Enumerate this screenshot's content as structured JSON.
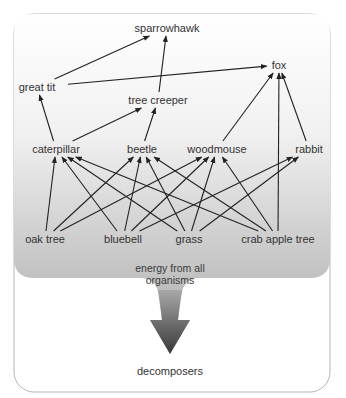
{
  "diagram": {
    "nodes": {
      "sparrowhawk": {
        "label": "sparrowhawk",
        "x": 167,
        "y": 28
      },
      "fox": {
        "label": "fox",
        "x": 279,
        "y": 65
      },
      "great_tit": {
        "label": "great tit",
        "x": 37,
        "y": 87
      },
      "tree_creeper": {
        "label": "tree creeper",
        "x": 158,
        "y": 100
      },
      "caterpillar": {
        "label": "caterpillar",
        "x": 56,
        "y": 149
      },
      "beetle": {
        "label": "beetle",
        "x": 142,
        "y": 149
      },
      "woodmouse": {
        "label": "woodmouse",
        "x": 217,
        "y": 149
      },
      "rabbit": {
        "label": "rabbit",
        "x": 309,
        "y": 149
      },
      "oak_tree": {
        "label": "oak tree",
        "x": 45,
        "y": 239
      },
      "bluebell": {
        "label": "bluebell",
        "x": 123,
        "y": 239
      },
      "grass": {
        "label": "grass",
        "x": 189,
        "y": 239
      },
      "crab_apple_tree": {
        "label": "crab apple tree",
        "x": 278,
        "y": 239
      }
    },
    "edges": [
      {
        "from": "oak_tree",
        "to": "caterpillar"
      },
      {
        "from": "oak_tree",
        "to": "beetle"
      },
      {
        "from": "oak_tree",
        "to": "woodmouse"
      },
      {
        "from": "bluebell",
        "to": "caterpillar"
      },
      {
        "from": "bluebell",
        "to": "beetle"
      },
      {
        "from": "bluebell",
        "to": "woodmouse"
      },
      {
        "from": "bluebell",
        "to": "rabbit"
      },
      {
        "from": "grass",
        "to": "caterpillar"
      },
      {
        "from": "grass",
        "to": "beetle"
      },
      {
        "from": "grass",
        "to": "woodmouse"
      },
      {
        "from": "grass",
        "to": "rabbit"
      },
      {
        "from": "crab_apple_tree",
        "to": "caterpillar"
      },
      {
        "from": "crab_apple_tree",
        "to": "beetle"
      },
      {
        "from": "crab_apple_tree",
        "to": "woodmouse"
      },
      {
        "from": "crab_apple_tree",
        "to": "fox"
      },
      {
        "from": "caterpillar",
        "to": "great_tit"
      },
      {
        "from": "caterpillar",
        "to": "tree_creeper"
      },
      {
        "from": "beetle",
        "to": "tree_creeper"
      },
      {
        "from": "woodmouse",
        "to": "fox"
      },
      {
        "from": "rabbit",
        "to": "fox"
      },
      {
        "from": "great_tit",
        "to": "sparrowhawk"
      },
      {
        "from": "great_tit",
        "to": "fox"
      },
      {
        "from": "tree_creeper",
        "to": "sparrowhawk"
      }
    ],
    "energy_caption_line1": "energy from all",
    "energy_caption_line2": "organisms",
    "decomposers_label": "decomposers",
    "colors": {
      "line": "#222222",
      "border": "#b5b5b5",
      "gradient_top": "#ffffff",
      "gradient_bottom": "#a9a9a9",
      "arrow_dark": "#3c3c3c"
    }
  }
}
